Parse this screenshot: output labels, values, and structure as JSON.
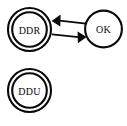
{
  "diagram": {
    "type": "state-transition-diagram",
    "background_color": "#ffffff",
    "stroke_color": "#0a0a0a",
    "nodes": [
      {
        "id": "ddr",
        "label": "DDR",
        "shape": "double-circle",
        "cx": 29.5,
        "cy": 29.5,
        "r_outer": 21.5,
        "r_inner": 17.5
      },
      {
        "id": "ok",
        "label": "OK",
        "shape": "circle",
        "cx": 103.5,
        "cy": 29.0,
        "r_outer": 18.5,
        "r_inner": 18.5
      },
      {
        "id": "ddu",
        "label": "DDU",
        "shape": "double-circle",
        "cx": 29.5,
        "cy": 90.5,
        "r_outer": 21.5,
        "r_inner": 17.5
      }
    ],
    "edges": [
      {
        "id": "ok-to-ddr",
        "from": "ok",
        "to": "ddr",
        "label": "",
        "direction": "left",
        "arrowhead": "filled-triangle"
      },
      {
        "id": "ddr-to-ok",
        "from": "ddr",
        "to": "ok",
        "label": "",
        "direction": "right",
        "arrowhead": "filled-triangle"
      }
    ]
  }
}
